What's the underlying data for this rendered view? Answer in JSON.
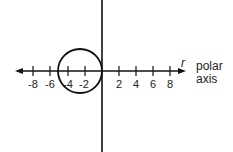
{
  "diagram": {
    "type": "polar-graph",
    "axis_label_r": "r",
    "polar_axis_label_line1": "polar",
    "polar_axis_label_line2": "axis",
    "ticks": [
      {
        "value": -8,
        "label": "-8",
        "x": 33
      },
      {
        "value": -6,
        "label": "-6",
        "x": 50
      },
      {
        "value": -4,
        "label": "-4",
        "x": 68
      },
      {
        "value": -2,
        "label": "-2",
        "x": 85
      },
      {
        "value": 2,
        "label": "2",
        "x": 119
      },
      {
        "value": 4,
        "label": "4",
        "x": 136
      },
      {
        "value": 6,
        "label": "6",
        "x": 153
      },
      {
        "value": 8,
        "label": "8",
        "x": 170
      }
    ],
    "curve": {
      "shape": "circle",
      "center": [
        -2.5,
        0
      ],
      "radius": 2.5
    },
    "colors": {
      "stroke": "#111111",
      "background": "#ffffff"
    }
  }
}
